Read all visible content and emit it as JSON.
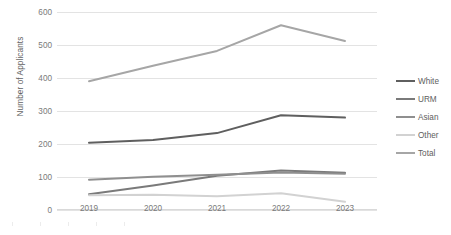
{
  "chart_data": {
    "type": "line",
    "title": "",
    "xlabel": "",
    "ylabel": "Number of Applicants",
    "categories": [
      "2019",
      "2020",
      "2021",
      "2022",
      "2023"
    ],
    "x": [
      2019,
      2020,
      2021,
      2022,
      2023
    ],
    "ylim": [
      0,
      600
    ],
    "yticks": [
      0,
      100,
      200,
      300,
      400,
      500,
      600
    ],
    "ytick_labels": [
      "0",
      "100",
      "200",
      "300",
      "400",
      "500",
      "600"
    ],
    "grid": true,
    "legend_position": "right",
    "series": [
      {
        "name": "White",
        "values": [
          204,
          212,
          233,
          287,
          280
        ],
        "color": "#5f5f5f"
      },
      {
        "name": "URM",
        "values": [
          48,
          74,
          104,
          120,
          113
        ],
        "color": "#7a7a7a"
      },
      {
        "name": "Asian",
        "values": [
          92,
          101,
          107,
          114,
          110
        ],
        "color": "#8f8f8f"
      },
      {
        "name": "Other",
        "values": [
          45,
          46,
          42,
          51,
          25
        ],
        "color": "#d2d2d2"
      },
      {
        "name": "Total",
        "values": [
          390,
          437,
          482,
          560,
          512
        ],
        "color": "#a6a6a6"
      }
    ]
  },
  "legend": {
    "items": [
      {
        "label": "White"
      },
      {
        "label": "URM"
      },
      {
        "label": "Asian"
      },
      {
        "label": "Other"
      },
      {
        "label": "Total"
      }
    ]
  }
}
